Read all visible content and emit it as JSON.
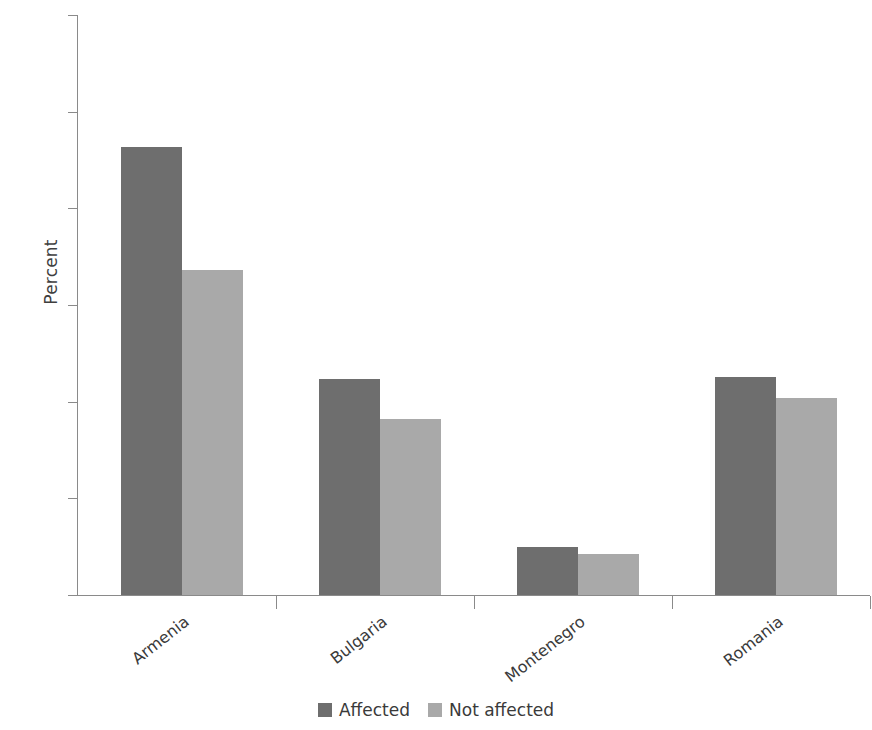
{
  "chart_data": {
    "type": "bar",
    "title": "",
    "subtitle": "",
    "xlabel": "",
    "ylabel": "Percent",
    "ylim": [
      0,
      60
    ],
    "yticks": [
      0,
      10,
      20,
      30,
      40,
      50,
      60
    ],
    "ytick_labels": [
      "0",
      "10",
      "20",
      "30",
      "40",
      "50",
      "60"
    ],
    "grid": false,
    "legend_position": "bottom-center",
    "categories": [
      "Armenia",
      "Bulgaria",
      "Montenegro",
      "Romania"
    ],
    "series": [
      {
        "name": "Affected",
        "color": "#6e6e6e",
        "values": [
          46.3,
          22.3,
          5.0,
          22.6
        ]
      },
      {
        "name": "Not affected",
        "color": "#a9a9a9",
        "values": [
          33.6,
          18.2,
          4.2,
          20.4
        ]
      }
    ]
  },
  "legend": {
    "items": [
      {
        "label": "Affected",
        "color": "#6e6e6e"
      },
      {
        "label": "Not affected",
        "color": "#a9a9a9"
      }
    ]
  },
  "axes": {
    "y_title": "Percent",
    "y_tick_labels": [
      "60",
      "50",
      "40",
      "30",
      "20",
      "10",
      "0"
    ],
    "x_tick_labels": [
      "Armenia",
      "Bulgaria",
      "Montenegro",
      "Romania"
    ]
  },
  "colors": {
    "affected": "#6e6e6e",
    "not_affected": "#a9a9a9",
    "axis": "#8a8a8a",
    "text": "#3a3a3a",
    "background": "#ffffff"
  }
}
